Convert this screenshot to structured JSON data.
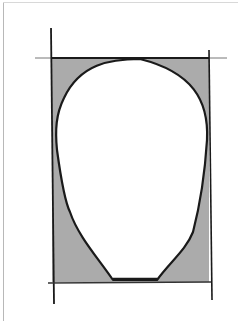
{
  "diagram": {
    "colors": {
      "background": "#ffffff",
      "fill": "#ababab",
      "stroke": "#1a1a1a",
      "guide": "#555555"
    },
    "rectangle": {
      "left": 52,
      "top": 58,
      "right": 209,
      "bottom": 282
    },
    "face_outline": "M140,59 C110,59 80,62 62,100 C55,115 56,140 58,150 C62,170 66,200 70,215 C78,240 95,255 113,280 L157,280 C170,260 185,250 193,230 C200,200 206,170 207,140 C208,100 190,75 140,59 Z"
  }
}
